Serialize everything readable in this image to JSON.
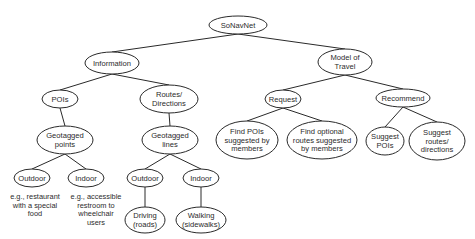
{
  "diagram": {
    "type": "tree",
    "root": "SoNavNet",
    "nodes": [
      {
        "id": "sonavnet",
        "lines": [
          "SoNavNet"
        ],
        "cx": 238,
        "cy": 25,
        "rx": 29,
        "ry": 9
      },
      {
        "id": "information",
        "lines": [
          "Information"
        ],
        "cx": 112,
        "cy": 63,
        "rx": 27,
        "ry": 11
      },
      {
        "id": "model-of-travel",
        "lines": [
          "Model of",
          "Travel"
        ],
        "cx": 345,
        "cy": 62,
        "rx": 27,
        "ry": 13
      },
      {
        "id": "pois",
        "lines": [
          "POIs"
        ],
        "cx": 60,
        "cy": 99,
        "rx": 18,
        "ry": 9
      },
      {
        "id": "routes-directions",
        "lines": [
          "Routes/",
          "Directions"
        ],
        "cx": 169,
        "cy": 99,
        "rx": 29,
        "ry": 14
      },
      {
        "id": "request",
        "lines": [
          "Request"
        ],
        "cx": 283,
        "cy": 99,
        "rx": 18,
        "ry": 9
      },
      {
        "id": "recommend",
        "lines": [
          "Recommend"
        ],
        "cx": 403,
        "cy": 98,
        "rx": 27,
        "ry": 9
      },
      {
        "id": "geotagged-points",
        "lines": [
          "Geotagged",
          "points"
        ],
        "cx": 65,
        "cy": 140,
        "rx": 28,
        "ry": 14
      },
      {
        "id": "geotagged-lines",
        "lines": [
          "Geotagged",
          "lines"
        ],
        "cx": 170,
        "cy": 140,
        "rx": 28,
        "ry": 14
      },
      {
        "id": "find-pois",
        "lines": [
          "Find POIs",
          "suggested by",
          "members"
        ],
        "cx": 247,
        "cy": 140,
        "rx": 31,
        "ry": 19
      },
      {
        "id": "find-routes",
        "lines": [
          "Find optional",
          "routes suggested",
          "by members"
        ],
        "cx": 322,
        "cy": 140,
        "rx": 35,
        "ry": 19
      },
      {
        "id": "suggest-pois",
        "lines": [
          "Suggest",
          "POIs"
        ],
        "cx": 385,
        "cy": 141,
        "rx": 19,
        "ry": 14
      },
      {
        "id": "suggest-routes",
        "lines": [
          "Suggest",
          "routes/",
          "directions"
        ],
        "cx": 437,
        "cy": 141,
        "rx": 28,
        "ry": 19
      },
      {
        "id": "outdoor-points",
        "lines": [
          "Outdoor"
        ],
        "cx": 32,
        "cy": 178,
        "rx": 18,
        "ry": 9
      },
      {
        "id": "indoor-points",
        "lines": [
          "Indoor"
        ],
        "cx": 86,
        "cy": 178,
        "rx": 18,
        "ry": 9
      },
      {
        "id": "outdoor-lines",
        "lines": [
          "Outdoor"
        ],
        "cx": 145,
        "cy": 178,
        "rx": 18,
        "ry": 9
      },
      {
        "id": "indoor-lines",
        "lines": [
          "Indoor"
        ],
        "cx": 201,
        "cy": 178,
        "rx": 18,
        "ry": 9
      },
      {
        "id": "driving",
        "lines": [
          "Driving",
          "(roads)"
        ],
        "cx": 145,
        "cy": 220,
        "rx": 20,
        "ry": 13
      },
      {
        "id": "walking",
        "lines": [
          "Walking",
          "(sidewalks)"
        ],
        "cx": 201,
        "cy": 220,
        "rx": 25,
        "ry": 13
      }
    ],
    "edges": [
      [
        "sonavnet",
        "information"
      ],
      [
        "sonavnet",
        "model-of-travel"
      ],
      [
        "information",
        "pois"
      ],
      [
        "information",
        "routes-directions"
      ],
      [
        "model-of-travel",
        "request"
      ],
      [
        "model-of-travel",
        "recommend"
      ],
      [
        "pois",
        "geotagged-points"
      ],
      [
        "routes-directions",
        "geotagged-lines"
      ],
      [
        "request",
        "find-pois"
      ],
      [
        "request",
        "find-routes"
      ],
      [
        "recommend",
        "suggest-pois"
      ],
      [
        "recommend",
        "suggest-routes"
      ],
      [
        "geotagged-points",
        "outdoor-points"
      ],
      [
        "geotagged-points",
        "indoor-points"
      ],
      [
        "geotagged-lines",
        "outdoor-lines"
      ],
      [
        "geotagged-lines",
        "indoor-lines"
      ],
      [
        "outdoor-lines",
        "driving"
      ],
      [
        "indoor-lines",
        "walking"
      ]
    ],
    "captions": [
      {
        "id": "caption-outdoor-example",
        "lines": [
          "e.g., restaurant",
          "with a special",
          "food"
        ],
        "x": 35,
        "y": 199
      },
      {
        "id": "caption-indoor-example",
        "lines": [
          "e.g., accessible",
          "restroom to",
          "wheelchair",
          "users"
        ],
        "x": 96,
        "y": 199
      }
    ]
  }
}
